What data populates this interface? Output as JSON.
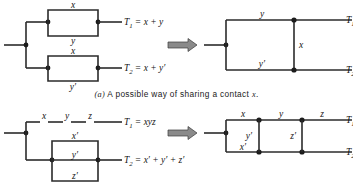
{
  "figure": {
    "panels": [
      {
        "id": "panel-a",
        "caption_tag": "(a)",
        "caption_text": "A possible way of sharing a contact",
        "caption_var": "x",
        "caption_end": ".",
        "arrow": "double-right-arrow",
        "left_network": {
          "name": "two-separate-parallel-networks",
          "branches": [
            {
              "output": "T",
              "output_sub": "1",
              "equals": "=",
              "expression": "x + y",
              "contacts": [
                "x",
                "y"
              ]
            },
            {
              "output": "T",
              "output_sub": "2",
              "equals": "=",
              "expression": "x + y′",
              "contacts": [
                "x",
                "y′"
              ]
            }
          ]
        },
        "right_network": {
          "name": "shared-contact-bridge-network",
          "top_contact": "y",
          "bottom_contact": "y′",
          "shared_contact": "x",
          "outputs": [
            {
              "label": "T",
              "sub": "1"
            },
            {
              "label": "T",
              "sub": "2"
            }
          ]
        }
      },
      {
        "id": "panel-b",
        "caption_tag": "",
        "caption_text": "",
        "caption_var": "",
        "caption_end": "",
        "arrow": "double-right-arrow",
        "left_network": {
          "name": "series-and-parallel-networks",
          "branches": [
            {
              "output": "T",
              "output_sub": "1",
              "equals": "=",
              "expression": "xyz",
              "contacts": [
                "x",
                "y",
                "z"
              ]
            },
            {
              "output": "T",
              "output_sub": "2",
              "equals": "=",
              "expression": "x′ + y′ + z′",
              "contacts": [
                "x′",
                "y′",
                "z′"
              ]
            }
          ]
        },
        "right_network": {
          "name": "bridge-network-three-contacts",
          "top_contacts": [
            "x",
            "y",
            "z"
          ],
          "bottom_contacts": [
            "x′"
          ],
          "bridge_contacts": [
            "y′",
            "z′"
          ],
          "outputs": [
            {
              "label": "T",
              "sub": "1"
            },
            {
              "label": "T",
              "sub": "2"
            }
          ]
        }
      }
    ],
    "colors": {
      "wire": "#2b2b2b",
      "node": "#1c1c1c",
      "arrow_fill": "#8a8a8a",
      "text": "#141414",
      "background": "#ffffff"
    }
  }
}
